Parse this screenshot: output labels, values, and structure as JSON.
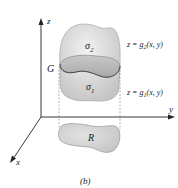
{
  "figure": {
    "caption": "(b)",
    "axes": {
      "z": "z",
      "y": "y",
      "x": "x"
    },
    "labels": {
      "upper_surface": "σ",
      "upper_surface_sub": "2",
      "lower_surface": "σ",
      "lower_surface_sub": "1",
      "solid": "G",
      "region": "R",
      "eq_upper": "z = g",
      "eq_upper_sub": "2",
      "eq_upper_args": "(x, y)",
      "eq_lower": "z = g",
      "eq_lower_sub": "1",
      "eq_lower_args": "(x, y)"
    },
    "colors": {
      "surface_fill": "#d8d8d8",
      "band_fill": "#b8b8b8",
      "region_fill": "#cfcfcf",
      "axis": "#222222"
    }
  }
}
